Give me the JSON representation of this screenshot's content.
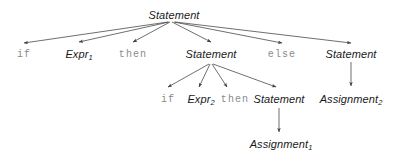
{
  "diagram": {
    "type": "parse-tree",
    "title": "",
    "colors": {
      "background": "#ffffff",
      "nonterminal_text": "#1a1a1a",
      "terminal_text": "#8a8a8a",
      "edge": "#4a4a4a"
    },
    "nodes": [
      {
        "id": "root",
        "label": "Statement",
        "sub": "",
        "kind": "nonterminal",
        "x": 174,
        "y": 10
      },
      {
        "id": "if1",
        "label": "if",
        "sub": "",
        "kind": "terminal",
        "x": 24,
        "y": 50
      },
      {
        "id": "expr1",
        "label": "Expr",
        "sub": "1",
        "kind": "nonterminal",
        "x": 79,
        "y": 49
      },
      {
        "id": "then1",
        "label": "then",
        "sub": "",
        "kind": "terminal",
        "x": 133,
        "y": 50
      },
      {
        "id": "stmt2",
        "label": "Statement",
        "sub": "",
        "kind": "nonterminal",
        "x": 211,
        "y": 49
      },
      {
        "id": "else1",
        "label": "else",
        "sub": "",
        "kind": "terminal",
        "x": 282,
        "y": 50
      },
      {
        "id": "stmt3",
        "label": "Statement",
        "sub": "",
        "kind": "nonterminal",
        "x": 351,
        "y": 49
      },
      {
        "id": "if2",
        "label": "if",
        "sub": "",
        "kind": "terminal",
        "x": 168,
        "y": 95
      },
      {
        "id": "expr2",
        "label": "Expr",
        "sub": "2",
        "kind": "nonterminal",
        "x": 201,
        "y": 94
      },
      {
        "id": "then2",
        "label": "then",
        "sub": "",
        "kind": "terminal",
        "x": 235,
        "y": 95
      },
      {
        "id": "stmt4",
        "label": "Statement",
        "sub": "",
        "kind": "nonterminal",
        "x": 279,
        "y": 94
      },
      {
        "id": "assign2",
        "label": "Assignment",
        "sub": "2",
        "kind": "nonterminal",
        "x": 351,
        "y": 94
      },
      {
        "id": "assign1",
        "label": "Assignment",
        "sub": "1",
        "kind": "nonterminal",
        "x": 281,
        "y": 139
      }
    ],
    "edges": [
      {
        "from": "root",
        "to": "if1",
        "x1": 168,
        "y1": 22,
        "x2": 24,
        "y2": 43
      },
      {
        "from": "root",
        "to": "expr1",
        "x1": 169,
        "y1": 22,
        "x2": 79,
        "y2": 42
      },
      {
        "from": "root",
        "to": "then1",
        "x1": 170,
        "y1": 22,
        "x2": 133,
        "y2": 42
      },
      {
        "from": "root",
        "to": "stmt2",
        "x1": 172,
        "y1": 22,
        "x2": 211,
        "y2": 42
      },
      {
        "from": "root",
        "to": "else1",
        "x1": 174,
        "y1": 22,
        "x2": 282,
        "y2": 43
      },
      {
        "from": "root",
        "to": "stmt3",
        "x1": 175,
        "y1": 22,
        "x2": 351,
        "y2": 43
      },
      {
        "from": "stmt2",
        "to": "if2",
        "x1": 209,
        "y1": 64,
        "x2": 168,
        "y2": 87
      },
      {
        "from": "stmt2",
        "to": "expr2",
        "x1": 210,
        "y1": 64,
        "x2": 199,
        "y2": 87
      },
      {
        "from": "stmt2",
        "to": "then2",
        "x1": 212,
        "y1": 64,
        "x2": 227,
        "y2": 87
      },
      {
        "from": "stmt2",
        "to": "stmt4",
        "x1": 213,
        "y1": 64,
        "x2": 276,
        "y2": 87
      },
      {
        "from": "stmt3",
        "to": "assign2",
        "x1": 351,
        "y1": 62,
        "x2": 351,
        "y2": 86
      },
      {
        "from": "stmt4",
        "to": "assign1",
        "x1": 279,
        "y1": 108,
        "x2": 279,
        "y2": 132
      }
    ]
  }
}
